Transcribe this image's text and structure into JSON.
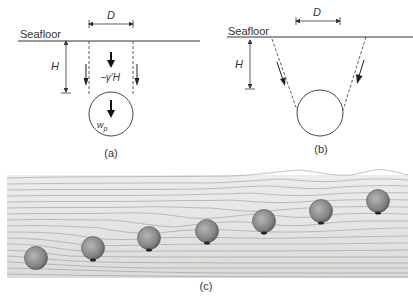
{
  "panel_a": {
    "seafloor_label": "Seafloor",
    "width_label": "D",
    "depth_label": "H",
    "soil_load_label": "−γ′H",
    "pipe_weight_label": "w",
    "pipe_weight_subscript": "p",
    "caption": "(a)"
  },
  "panel_b": {
    "seafloor_label": "Seafloor",
    "width_label": "D",
    "depth_label": "H",
    "caption": "(b)"
  },
  "panel_c": {
    "caption": "(c)",
    "pipe_count": 7
  },
  "colors": {
    "line": "#333333",
    "photo_background": "#e6e6e4",
    "pipe_fill": "#8a8a8a"
  }
}
